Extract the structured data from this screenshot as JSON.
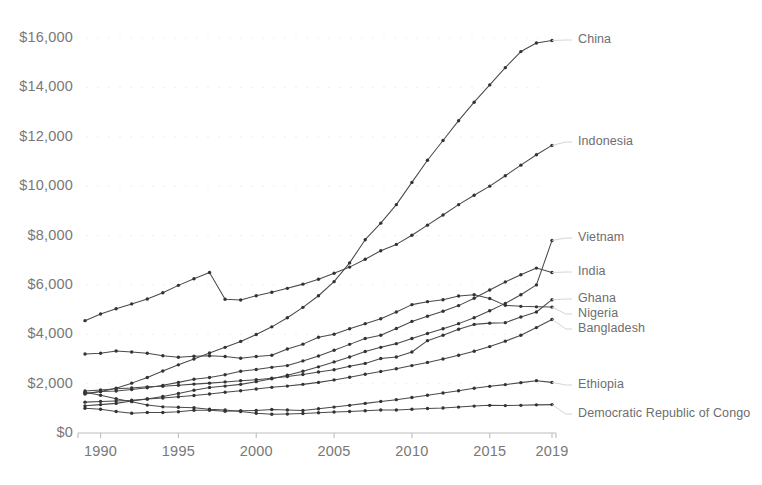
{
  "chart_data": {
    "type": "line",
    "title": "",
    "subtitle": "",
    "xlabel": "",
    "ylabel": "",
    "xlim": [
      1989,
      2019
    ],
    "ylim": [
      0,
      16500
    ],
    "grid": false,
    "legend_position": "right-inline",
    "y_tick_labels": [
      "$16,000",
      "$14,000",
      "$12,000",
      "$10,000",
      "$8,000",
      "$6,000",
      "$4,000",
      "$2,000",
      "$0"
    ],
    "y_tick_values": [
      16000,
      14000,
      12000,
      10000,
      8000,
      6000,
      4000,
      2000,
      0
    ],
    "x_tick_labels": [
      "1990",
      "1995",
      "2000",
      "2005",
      "2010",
      "2015",
      "2019"
    ],
    "x_tick_values": [
      1990,
      1995,
      2000,
      2005,
      2010,
      2015,
      2019
    ],
    "x": [
      1989,
      1990,
      1991,
      1992,
      1993,
      1994,
      1995,
      1996,
      1997,
      1998,
      1999,
      2000,
      2001,
      2002,
      2003,
      2004,
      2005,
      2006,
      2007,
      2008,
      2009,
      2010,
      2011,
      2012,
      2013,
      2014,
      2015,
      2016,
      2017,
      2018,
      2019
    ],
    "line_color": "#4a4a4a",
    "marker_color": "#333333",
    "axis_color": "#bdbdbd",
    "series": [
      {
        "name": "China",
        "color": "#4a4a4a",
        "values": [
          1580,
          1680,
          1810,
          2020,
          2250,
          2510,
          2760,
          3000,
          3240,
          3470,
          3710,
          3990,
          4300,
          4670,
          5090,
          5560,
          6130,
          6890,
          7830,
          8500,
          9250,
          10150,
          11050,
          11850,
          12650,
          13400,
          14100,
          14800,
          15450,
          15800,
          15900
        ]
      },
      {
        "name": "Indonesia",
        "color": "#4a4a4a",
        "values": [
          4550,
          4820,
          5030,
          5230,
          5430,
          5680,
          5980,
          6250,
          6500,
          5420,
          5390,
          5560,
          5700,
          5860,
          6030,
          6230,
          6470,
          6720,
          7040,
          7380,
          7640,
          8010,
          8420,
          8830,
          9250,
          9630,
          10000,
          10420,
          10850,
          11270,
          11650
        ]
      },
      {
        "name": "Vietnam",
        "color": "#4a4a4a",
        "values": [
          1100,
          1150,
          1200,
          1300,
          1380,
          1480,
          1600,
          1730,
          1840,
          1900,
          1970,
          2080,
          2200,
          2340,
          2500,
          2680,
          2880,
          3080,
          3300,
          3470,
          3620,
          3830,
          4030,
          4220,
          4430,
          4670,
          4950,
          5250,
          5600,
          6000,
          7800
        ]
      },
      {
        "name": "India",
        "color": "#4a4a4a",
        "values": [
          1600,
          1680,
          1700,
          1760,
          1830,
          1930,
          2050,
          2180,
          2250,
          2360,
          2500,
          2570,
          2660,
          2730,
          2920,
          3120,
          3350,
          3590,
          3830,
          3960,
          4230,
          4520,
          4730,
          4930,
          5160,
          5460,
          5790,
          6120,
          6410,
          6680,
          6500
        ]
      },
      {
        "name": "Ghana",
        "color": "#4a4a4a",
        "values": [
          1700,
          1740,
          1790,
          1820,
          1870,
          1890,
          1930,
          1980,
          2020,
          2070,
          2120,
          2160,
          2220,
          2290,
          2370,
          2470,
          2560,
          2700,
          2820,
          3020,
          3080,
          3280,
          3740,
          3960,
          4200,
          4400,
          4450,
          4470,
          4700,
          4900,
          5400
        ]
      },
      {
        "name": "Nigeria",
        "color": "#4a4a4a",
        "values": [
          3200,
          3230,
          3320,
          3280,
          3230,
          3130,
          3070,
          3110,
          3130,
          3100,
          3030,
          3100,
          3150,
          3400,
          3600,
          3880,
          4000,
          4220,
          4430,
          4630,
          4900,
          5200,
          5320,
          5400,
          5550,
          5600,
          5450,
          5170,
          5130,
          5110,
          5100
        ]
      },
      {
        "name": "Bangladesh",
        "color": "#4a4a4a",
        "values": [
          1250,
          1280,
          1300,
          1330,
          1380,
          1420,
          1470,
          1520,
          1580,
          1650,
          1710,
          1780,
          1850,
          1900,
          1970,
          2050,
          2150,
          2260,
          2380,
          2490,
          2600,
          2730,
          2860,
          3000,
          3150,
          3310,
          3500,
          3720,
          3960,
          4270,
          4600
        ]
      },
      {
        "name": "Ethiopia",
        "color": "#4a4a4a",
        "values": [
          1000,
          960,
          870,
          800,
          830,
          830,
          860,
          920,
          920,
          880,
          900,
          910,
          950,
          930,
          910,
          980,
          1050,
          1120,
          1200,
          1280,
          1350,
          1440,
          1530,
          1620,
          1710,
          1810,
          1890,
          1960,
          2040,
          2120,
          2050
        ]
      },
      {
        "name": "Democratic Republic of Congo",
        "color": "#4a4a4a",
        "values": [
          1650,
          1530,
          1390,
          1270,
          1130,
          1060,
          1040,
          1020,
          960,
          930,
          870,
          800,
          760,
          770,
          790,
          820,
          850,
          870,
          900,
          930,
          930,
          960,
          990,
          1010,
          1050,
          1090,
          1120,
          1110,
          1120,
          1140,
          1150
        ]
      }
    ],
    "series_label_positions": [
      {
        "name": "China",
        "label": "China",
        "y": 40
      },
      {
        "name": "Indonesia",
        "label": "Indonesia",
        "y": 142
      },
      {
        "name": "Vietnam",
        "label": "Vietnam",
        "y": 238
      },
      {
        "name": "India",
        "label": "India",
        "y": 272
      },
      {
        "name": "Ghana",
        "label": "Ghana",
        "y": 299
      },
      {
        "name": "Nigeria",
        "label": "Nigeria",
        "y": 314
      },
      {
        "name": "Bangladesh",
        "label": "Bangladesh",
        "y": 329
      },
      {
        "name": "Ethiopia",
        "label": "Ethiopia",
        "y": 385
      },
      {
        "name": "Democratic Republic of Congo",
        "label": "Democratic Republic of Congo",
        "y": 414
      }
    ]
  }
}
